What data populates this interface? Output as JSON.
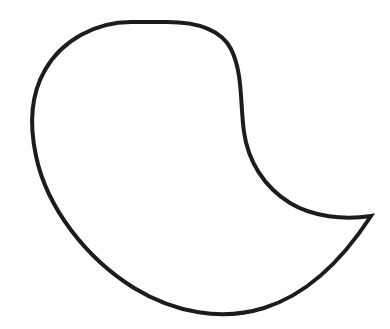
{
  "canvas": {
    "width": 390,
    "height": 329,
    "background_color": "#ffffff",
    "title": "Paisley teardrop outline drawing"
  },
  "drawing": {
    "name": "paisley-outline",
    "description": "Single closed freehand outline of a paisley / comma / teardrop shape with a pointed cusp at the right",
    "stroke_color": "#1c1c1c",
    "stroke_width": 4,
    "fill": "none",
    "path": "M 131 22 C 96 22 62 40 45 70 C 30 96 30 128 36 156 C 47 208 86 258 134 288 C 175 313 222 321 264 308 C 309 294 345 256 371 216 C 344 220 313 217 290 203 C 264 187 248 161 244 132 C 240 103 243 73 231 49 C 221 30 197 22 167 22 Z",
    "subpaths": [
      {
        "name": "upper-body-arc",
        "description": "Large rounded arc from top across the left and down to the bottom",
        "d": "M 131 22 C 96 22 62 40 45 70 C 30 96 30 128 36 156 C 47 208 86 258 134 288"
      },
      {
        "name": "lower-sweep-to-cusp",
        "description": "Lower right sweep curving up to the pointed tail tip",
        "d": "M 134 288 C 175 313 222 321 264 308 C 309 294 345 256 371 216"
      },
      {
        "name": "inner-concave-curve",
        "description": "Concave inner curve returning from the cusp back up to the top",
        "d": "M 371 216 C 344 220 313 217 290 203 C 264 187 248 161 244 132 C 240 103 243 73 231 49 C 221 30 197 22 167 22"
      }
    ],
    "key_points": [
      {
        "name": "top-apex",
        "x": 131,
        "y": 22
      },
      {
        "name": "left-extreme",
        "x": 33,
        "y": 130
      },
      {
        "name": "bottom-extreme",
        "x": 195,
        "y": 312
      },
      {
        "name": "tail-cusp-tip",
        "x": 371,
        "y": 216
      },
      {
        "name": "inner-notch",
        "x": 290,
        "y": 203
      }
    ]
  }
}
